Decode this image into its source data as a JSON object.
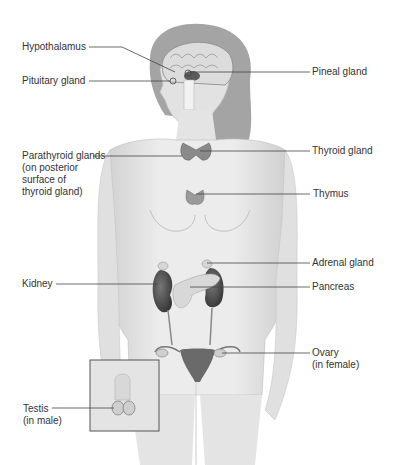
{
  "diagram": {
    "type": "anatomical-illustration",
    "labels": {
      "hypothalamus": "Hypothalamus",
      "pituitary": "Pituitary gland",
      "pineal": "Pineal gland",
      "thyroid": "Thyroid gland",
      "parathyroid_1": "Parathyroid glands",
      "parathyroid_2": "(on posterior",
      "parathyroid_3": "surface of",
      "parathyroid_4": "thyroid gland)",
      "thymus": "Thymus",
      "adrenal": "Adrenal gland",
      "kidney": "Kidney",
      "pancreas": "Pancreas",
      "ovary_1": "Ovary",
      "ovary_2": "(in female)",
      "testis_1": "Testis",
      "testis_2": "(in male)"
    },
    "colors": {
      "background": "#ffffff",
      "skin": "#e6e6e6",
      "skin_shadow": "#c8c8c8",
      "hair": "#9a9a9a",
      "organ_dark": "#505050",
      "organ_light": "#d4d4d4",
      "leader_line": "#444444",
      "text": "#333333"
    }
  }
}
